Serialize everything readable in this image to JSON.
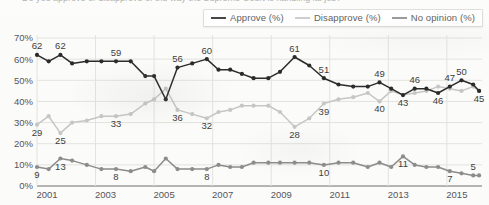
{
  "cut_title": "Do you approve or disapprove of the way the Supreme Court is handling its job?",
  "legend": {
    "position": "top-right",
    "items": [
      {
        "label": "Approve (%)",
        "color": "#2b2b2b",
        "name": "approve"
      },
      {
        "label": "Disapprove (%)",
        "color": "#c6c6c6",
        "name": "disapprove"
      },
      {
        "label": "No opinion (%)",
        "color": "#8c8c8c",
        "name": "no-opinion"
      }
    ]
  },
  "axes": {
    "y_ticks": [
      "0%",
      "10%",
      "20%",
      "30%",
      "40%",
      "50%",
      "60%",
      "70%"
    ],
    "x_ticks": [
      "2001",
      "2003",
      "2005",
      "2007",
      "2009",
      "2011",
      "2013",
      "2015"
    ]
  },
  "chart_data": {
    "type": "line",
    "title": "",
    "xlabel": "",
    "ylabel": "",
    "ylim": [
      0,
      70
    ],
    "xlim": [
      2001,
      2016.2
    ],
    "grid": true,
    "legend_position": "top-right",
    "y_ticks": [
      0,
      10,
      20,
      30,
      40,
      50,
      60,
      70
    ],
    "x_tick_values": [
      2001,
      2003,
      2005,
      2007,
      2009,
      2011,
      2013,
      2015
    ],
    "x": [
      2001.0,
      2001.4,
      2001.8,
      2002.2,
      2002.7,
      2003.2,
      2003.7,
      2004.2,
      2004.7,
      2005.0,
      2005.4,
      2005.8,
      2006.3,
      2006.8,
      2007.2,
      2007.6,
      2008.0,
      2008.4,
      2008.9,
      2009.3,
      2009.8,
      2010.3,
      2010.8,
      2011.3,
      2011.8,
      2012.3,
      2012.7,
      2013.1,
      2013.5,
      2013.9,
      2014.3,
      2014.7,
      2015.1,
      2015.5,
      2015.9,
      2016.1
    ],
    "series": [
      {
        "name": "Approve (%)",
        "color": "#2b2b2b",
        "values": [
          62,
          59,
          62,
          58,
          59,
          59,
          59,
          59,
          52,
          52,
          41,
          56,
          58,
          60,
          55,
          55,
          53,
          51,
          51,
          54,
          61,
          57,
          51,
          48,
          47,
          47,
          49,
          46,
          43,
          46,
          46,
          44,
          47,
          50,
          48,
          45
        ],
        "labels": [
          {
            "index": 0,
            "value": 62,
            "pos": "above"
          },
          {
            "index": 2,
            "value": 62,
            "pos": "above"
          },
          {
            "index": 6,
            "value": 59,
            "pos": "above"
          },
          {
            "index": 11,
            "value": 56,
            "pos": "above"
          },
          {
            "index": 13,
            "value": 60,
            "pos": "above"
          },
          {
            "index": 20,
            "value": 61,
            "pos": "above"
          },
          {
            "index": 22,
            "value": 51,
            "pos": "above"
          },
          {
            "index": 26,
            "value": 49,
            "pos": "above"
          },
          {
            "index": 28,
            "value": 43,
            "pos": "below"
          },
          {
            "index": 29,
            "value": 46,
            "pos": "above"
          },
          {
            "index": 31,
            "value": 46,
            "pos": "below"
          },
          {
            "index": 32,
            "value": 47,
            "pos": "above"
          },
          {
            "index": 33,
            "value": 50,
            "pos": "above"
          },
          {
            "index": 35,
            "value": 45,
            "pos": "below"
          }
        ]
      },
      {
        "name": "Disapprove (%)",
        "color": "#c6c6c6",
        "values": [
          29,
          33,
          25,
          30,
          31,
          33,
          33,
          34,
          39,
          41,
          46,
          36,
          34,
          32,
          35,
          36,
          38,
          38,
          38,
          35,
          28,
          32,
          39,
          41,
          42,
          44,
          40,
          45,
          43,
          44,
          45,
          47,
          46,
          45,
          47,
          45
        ],
        "labels": [
          {
            "index": 0,
            "value": 29,
            "pos": "below"
          },
          {
            "index": 2,
            "value": 25,
            "pos": "below"
          },
          {
            "index": 6,
            "value": 33,
            "pos": "below"
          },
          {
            "index": 11,
            "value": 36,
            "pos": "below"
          },
          {
            "index": 13,
            "value": 32,
            "pos": "below"
          },
          {
            "index": 20,
            "value": 28,
            "pos": "below"
          },
          {
            "index": 22,
            "value": 39,
            "pos": "below"
          },
          {
            "index": 26,
            "value": 40,
            "pos": "below"
          }
        ]
      },
      {
        "name": "No opinion (%)",
        "color": "#8c8c8c",
        "values": [
          9,
          8,
          13,
          12,
          10,
          8,
          8,
          7,
          9,
          7,
          13,
          8,
          8,
          8,
          10,
          9,
          9,
          11,
          11,
          11,
          11,
          11,
          10,
          11,
          11,
          9,
          11,
          9,
          14,
          10,
          9,
          9,
          7,
          6,
          5,
          5
        ],
        "labels": [
          {
            "index": 0,
            "value": 9,
            "pos": "below"
          },
          {
            "index": 2,
            "value": 13,
            "pos": "below"
          },
          {
            "index": 6,
            "value": 8,
            "pos": "below"
          },
          {
            "index": 13,
            "value": 8,
            "pos": "below"
          },
          {
            "index": 22,
            "value": 10,
            "pos": "below"
          },
          {
            "index": 28,
            "value": 11,
            "pos": "below"
          },
          {
            "index": 32,
            "value": 7,
            "pos": "below"
          },
          {
            "index": 34,
            "value": 5,
            "pos": "above"
          }
        ]
      }
    ]
  }
}
